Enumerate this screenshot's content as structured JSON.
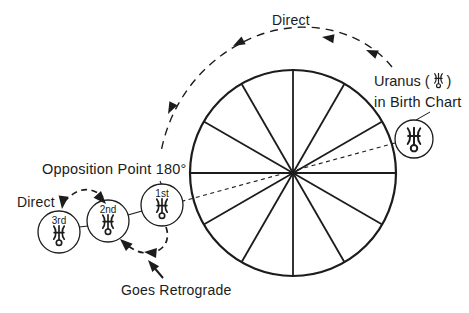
{
  "colors": {
    "ink": "#1c1c1c",
    "background": "#ffffff"
  },
  "labels": {
    "direct_top": "Direct",
    "uranus_prefix": "Uranus (",
    "uranus_suffix": ")",
    "in_birth_chart": "in Birth Chart",
    "opposition_point": "Opposition Point 180°",
    "direct_left": "Direct",
    "goes_retrograde": "Goes Retrograde"
  },
  "wheel": {
    "segments": 12
  },
  "passes": [
    {
      "label": "1st",
      "symbol": "uranus"
    },
    {
      "label": "2nd",
      "symbol": "uranus"
    },
    {
      "label": "3rd",
      "symbol": "uranus"
    }
  ],
  "icons": {
    "uranus_glyph": "uranus-astrological-symbol"
  }
}
